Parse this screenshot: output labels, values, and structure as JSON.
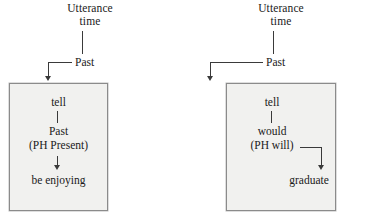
{
  "figure": {
    "type": "linguistic-tense-diagram",
    "background_color": "#ffffff",
    "box_fill_color": "#f1f1ef",
    "box_border_color": "#8b8b8b",
    "stroke_color": "#3a3a3a"
  },
  "diagrams": [
    {
      "id": "left",
      "header": {
        "line1": "Utterance",
        "line2": "time"
      },
      "anchor_label": "Past",
      "box": {
        "nodes": [
          {
            "label": "tell"
          },
          {
            "label": "Past"
          },
          {
            "label": "(PH Present)"
          },
          {
            "label": "be enjoying"
          }
        ],
        "connectors": [
          {
            "from": "tell",
            "to": "Past",
            "kind": "plain-line"
          },
          {
            "from": "(PH Present)",
            "to": "be enjoying",
            "kind": "down-arrow"
          }
        ]
      }
    },
    {
      "id": "right",
      "header": {
        "line1": "Utterance",
        "line2": "time"
      },
      "anchor_label": "Past",
      "box": {
        "nodes": [
          {
            "label": "tell"
          },
          {
            "label": "would"
          },
          {
            "label": "(PH will)"
          },
          {
            "label": "graduate"
          }
        ],
        "connectors": [
          {
            "from": "tell",
            "to": "would",
            "kind": "plain-line"
          },
          {
            "from": "(PH will)",
            "to": "graduate",
            "kind": "elbow-right-down-arrow"
          }
        ]
      }
    }
  ]
}
